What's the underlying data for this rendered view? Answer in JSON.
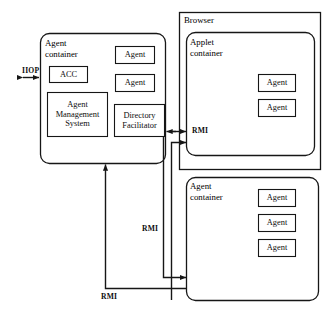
{
  "diagram": {
    "type": "architecture-block-diagram",
    "colors": {
      "background": "#ffffff",
      "stroke": "#161616",
      "text": "#0d0d0d"
    },
    "containers": [
      {
        "id": "agent-container-main",
        "label_lines": [
          "Agent",
          "container"
        ],
        "shape": "rounded-rect",
        "x": 40,
        "y": 33,
        "w": 126,
        "h": 131,
        "children": [
          "acc",
          "agent-management-system",
          "agent-main-1",
          "agent-main-2",
          "directory-facilitator"
        ]
      },
      {
        "id": "browser",
        "label_lines": [
          "Browser"
        ],
        "shape": "rect",
        "x": 179,
        "y": 12,
        "w": 142,
        "h": 158,
        "children": [
          "applet-container"
        ]
      },
      {
        "id": "applet-container",
        "label_lines": [
          "Applet",
          "container"
        ],
        "shape": "rounded-rect",
        "x": 186,
        "y": 32,
        "w": 129,
        "h": 124,
        "children": [
          "agent-applet-1",
          "agent-applet-2"
        ]
      },
      {
        "id": "agent-container-remote",
        "label_lines": [
          "Agent",
          "container"
        ],
        "shape": "rounded-rect",
        "x": 186,
        "y": 177,
        "w": 133,
        "h": 124,
        "children": [
          "agent-remote-1",
          "agent-remote-2",
          "agent-remote-3"
        ]
      }
    ],
    "boxes": [
      {
        "id": "acc",
        "label": "ACC",
        "x": 49,
        "y": 66,
        "w": 39,
        "h": 17
      },
      {
        "id": "agent-management-system",
        "label": "Agent Management System",
        "label_lines": [
          "Agent",
          "Management",
          "System"
        ],
        "x": 47,
        "y": 92,
        "w": 61,
        "h": 45
      },
      {
        "id": "agent-main-1",
        "label": "Agent",
        "x": 115,
        "y": 46,
        "w": 40,
        "h": 18
      },
      {
        "id": "agent-main-2",
        "label": "Agent",
        "x": 115,
        "y": 74,
        "w": 40,
        "h": 18
      },
      {
        "id": "directory-facilitator",
        "label": "Directory Facilitator",
        "label_lines": [
          "Directory",
          "Facilitator"
        ],
        "x": 114,
        "y": 104,
        "w": 51,
        "h": 33
      },
      {
        "id": "agent-applet-1",
        "label": "Agent",
        "x": 258,
        "y": 74,
        "w": 38,
        "h": 18
      },
      {
        "id": "agent-applet-2",
        "label": "Agent",
        "x": 258,
        "y": 99,
        "w": 38,
        "h": 18
      },
      {
        "id": "agent-remote-1",
        "label": "Agent",
        "x": 258,
        "y": 189,
        "w": 38,
        "h": 18
      },
      {
        "id": "agent-remote-2",
        "label": "Agent",
        "x": 258,
        "y": 214,
        "w": 38,
        "h": 18
      },
      {
        "id": "agent-remote-3",
        "label": "Agent",
        "x": 258,
        "y": 239,
        "w": 38,
        "h": 18
      }
    ],
    "connections": [
      {
        "id": "iiop-link",
        "label": "IIOP",
        "protocol": "IIOP",
        "direction": "bidirectional",
        "from": "external",
        "to": "agent-container-main"
      },
      {
        "id": "rmi-main-applet",
        "label": "RMI",
        "protocol": "RMI",
        "direction": "bidirectional",
        "from": "agent-container-main",
        "to": "applet-container"
      },
      {
        "id": "rmi-remote-applet",
        "label": "RMI",
        "protocol": "RMI",
        "direction": "unidirectional",
        "from": "agent-container-remote",
        "to": "applet-container"
      },
      {
        "id": "rmi-vertical",
        "label": "RMI",
        "protocol": "RMI",
        "direction": "unidirectional",
        "from": "applet-container",
        "to": "agent-container-remote"
      },
      {
        "id": "rmi-bottom",
        "label": "RMI",
        "protocol": "RMI",
        "direction": "unidirectional",
        "from": "agent-container-remote",
        "to": "agent-container-main"
      }
    ],
    "labels": {
      "iiop": "IIOP",
      "rmi_applet": "RMI",
      "rmi_vertical": "RMI",
      "rmi_bottom": "RMI"
    }
  }
}
